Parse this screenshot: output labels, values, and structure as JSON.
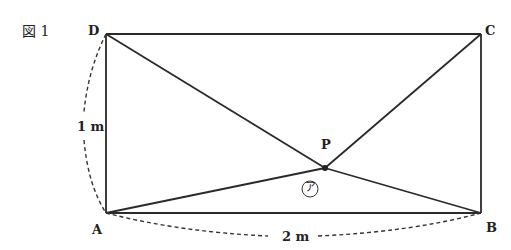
{
  "figure": {
    "title": "図 1",
    "points": {
      "A": {
        "label": "A",
        "x": 106,
        "y": 213
      },
      "B": {
        "label": "B",
        "x": 481,
        "y": 213
      },
      "C": {
        "label": "C",
        "x": 481,
        "y": 34
      },
      "D": {
        "label": "D",
        "x": 106,
        "y": 34
      },
      "P": {
        "label": "P",
        "x": 325,
        "y": 168
      }
    },
    "dimensions": {
      "height_label": "1 m",
      "width_label": "2 m"
    },
    "angle_marker": "㋐",
    "line_color": "#2a2a2a"
  }
}
